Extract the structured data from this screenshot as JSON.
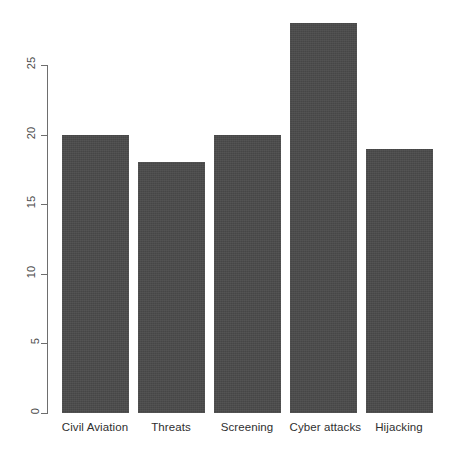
{
  "chart_data": {
    "type": "bar",
    "title": "",
    "subtitle": "",
    "xlabel": "",
    "ylabel": "",
    "categories": [
      "Civil Aviation",
      "Threats",
      "Screening",
      "Cyber attacks",
      "Hijacking"
    ],
    "values": [
      20,
      18,
      20,
      28,
      19
    ],
    "ylim": [
      0,
      28
    ],
    "y_ticks": [
      0,
      5,
      10,
      15,
      20,
      25
    ],
    "y_tick_labels": [
      "0",
      "5",
      "10",
      "15",
      "20",
      "25"
    ],
    "grid": false,
    "legend": null,
    "bar_color": "#4a4a4a",
    "axis_color": "#6e6e6e",
    "background_color": "#ffffff",
    "y_tick_label_rotation": -90,
    "annotations": []
  },
  "caption": {
    "clipped_text": ""
  }
}
